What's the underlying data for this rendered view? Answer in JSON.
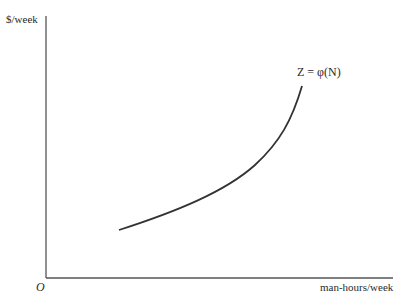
{
  "figure": {
    "y_axis_label": "$/week",
    "x_axis_label": "man-hours/week",
    "origin_label": "O",
    "curve_label": "Z = φ(N)",
    "line_color": "#2a2a2a",
    "background": "#ffffff"
  },
  "curve": {
    "description": "Upward-sloping convex curve, increasing at an increasing rate",
    "start": [
      119,
      230
    ],
    "end": [
      302,
      86
    ]
  }
}
